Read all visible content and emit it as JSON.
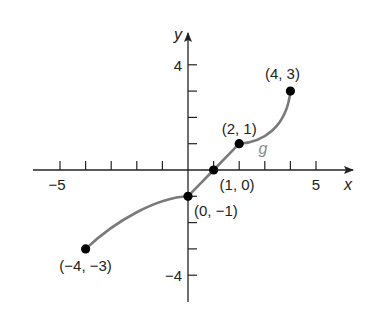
{
  "chart_data": {
    "type": "line",
    "title": "",
    "xlabel": "x",
    "ylabel": "y",
    "curve_label": "g",
    "xlim": [
      -5.5,
      6.3
    ],
    "ylim": [
      -4.8,
      5.2
    ],
    "x_ticks": [
      -5,
      -4,
      -3,
      -2,
      -1,
      1,
      2,
      3,
      4,
      5
    ],
    "x_tick_labels": [
      {
        "value": -5,
        "label": "−5"
      },
      {
        "value": 5,
        "label": "5"
      }
    ],
    "y_ticks": [
      -4,
      -3,
      -2,
      -1,
      1,
      2,
      3,
      4
    ],
    "y_tick_labels": [
      {
        "value": 4,
        "label": "4"
      },
      {
        "value": -4,
        "label": "−4"
      }
    ],
    "grid": false,
    "series": [
      {
        "name": "g",
        "color": "#7a7a7a",
        "points": [
          {
            "x": -4,
            "y": -3,
            "label": "(−4, −3)"
          },
          {
            "x": 0,
            "y": -1,
            "label": "(0, −1)"
          },
          {
            "x": 1,
            "y": 0,
            "label": "(1, 0)"
          },
          {
            "x": 2,
            "y": 1,
            "label": "(2, 1)"
          },
          {
            "x": 4,
            "y": 3,
            "label": "(4, 3)"
          }
        ]
      }
    ]
  },
  "colors": {
    "axis": "#222222",
    "curve": "#7a7a7a",
    "point": "#000000"
  }
}
